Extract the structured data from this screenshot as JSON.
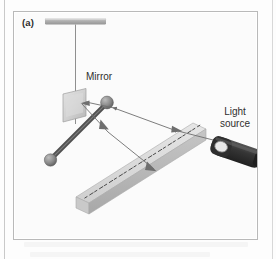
{
  "figure": {
    "panel_label": "(a)",
    "caption_labels": {
      "mirror": "Mirror",
      "light_source_line1": "Light",
      "light_source_line2": "source"
    },
    "apparatus": {
      "support_bar": "support-bar",
      "suspension_thread": "suspension-thread",
      "mirror_plate": "mirror-plate",
      "pendulum_rod": "pendulum-rod",
      "bob_upper": "pendulum-bob-upper",
      "bob_lower": "pendulum-bob-lower",
      "ruler": "ruler",
      "ruler_tick_count": 24,
      "flashlight": "flashlight",
      "flashlight_lens": "flashlight-lens",
      "incident_ray": "incident-light-ray",
      "reflected_ray": "reflected-light-ray"
    },
    "colors": {
      "panel_background": "#fbfbfb",
      "panel_border": "#b9b9b9",
      "page_background": "#fdfdfd",
      "support_bar": "#b4b4b4",
      "mirror_plate": "#d2d2d2",
      "pendulum_rod": "#5e5e5e",
      "bob": "#8a8a8a",
      "ruler_top": "#d9d9d9",
      "ruler_side": "#bdbdbd",
      "tick": "#4a4a4a",
      "flashlight_body": "#3a3a3a",
      "flashlight_lens": "#e8e8e8",
      "ray": "#6e6e6e",
      "label_text": "#2f2f2f"
    }
  }
}
